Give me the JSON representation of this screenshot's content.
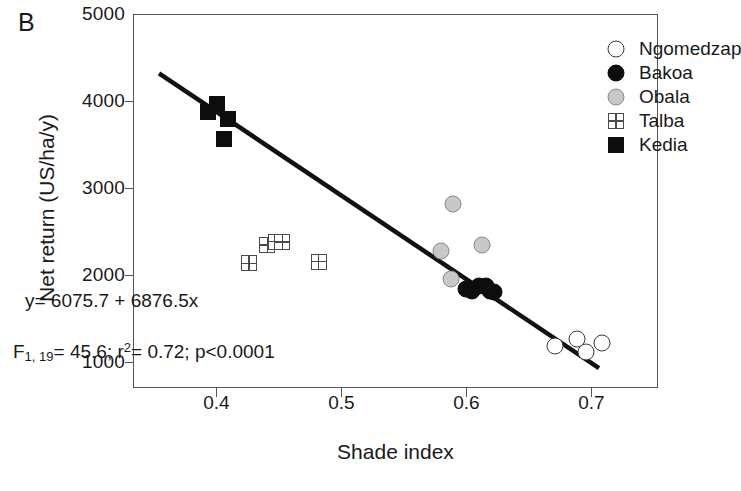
{
  "panel_label": "B",
  "chart_data": {
    "type": "scatter",
    "title": "",
    "xlabel": "Shade index",
    "ylabel": "Net return (US/ha/y)",
    "xlim": [
      0.3333,
      0.7533
    ],
    "ylim": [
      700,
      5000
    ],
    "xticks": [
      0.4,
      0.5,
      0.6,
      0.7
    ],
    "xtick_labels": [
      "0.4",
      "0.5",
      "0.6",
      "0.7"
    ],
    "yticks": [
      1000,
      2000,
      3000,
      4000,
      5000
    ],
    "ytick_labels": [
      "1000",
      "2000",
      "3000",
      "4000",
      "5000"
    ],
    "grid": false,
    "legend_position": "top-right",
    "annotations": {
      "equation": "y= 6075.7 + 6876.5x",
      "stat_f_symbol": "F",
      "stat_f_subscript": "1, 19",
      "stat_f_value": "= 45.6; ",
      "stat_r_symbol": "r",
      "stat_r_superscript": "2",
      "stat_r_value": "= 0.72; ",
      "stat_p_value": "p<0.0001"
    },
    "regression_line": {
      "x_start": 0.3533,
      "y_start": 4330,
      "x_end": 0.7053,
      "y_end": 940,
      "color": "#111111",
      "width": 4.5
    },
    "series": [
      {
        "name": "Ngomedzap",
        "marker": "circle-open",
        "color": "#ffffff",
        "edge_color": "#3a3a3a",
        "points": [
          {
            "x": 0.67,
            "y": 1195
          },
          {
            "x": 0.688,
            "y": 1270
          },
          {
            "x": 0.695,
            "y": 1130
          },
          {
            "x": 0.708,
            "y": 1230
          }
        ]
      },
      {
        "name": "Bakoa",
        "marker": "circle-filled",
        "color": "#0d0d0d",
        "edge_color": "#0d0d0d",
        "points": [
          {
            "x": 0.5985,
            "y": 1855
          },
          {
            "x": 0.604,
            "y": 1830
          },
          {
            "x": 0.609,
            "y": 1880
          },
          {
            "x": 0.615,
            "y": 1885
          },
          {
            "x": 0.618,
            "y": 1830
          },
          {
            "x": 0.6215,
            "y": 1815
          }
        ]
      },
      {
        "name": "Obala",
        "marker": "circle-grey",
        "color": "#c8c8c8",
        "edge_color": "#8a8a8a",
        "points": [
          {
            "x": 0.5885,
            "y": 2825
          },
          {
            "x": 0.579,
            "y": 2290
          },
          {
            "x": 0.6115,
            "y": 2360
          },
          {
            "x": 0.587,
            "y": 1965
          }
        ]
      },
      {
        "name": "Talba",
        "marker": "square-grid",
        "color": "#ffffff",
        "edge_color": "#4a4a4a",
        "points": [
          {
            "x": 0.4255,
            "y": 2145
          },
          {
            "x": 0.44,
            "y": 2355
          },
          {
            "x": 0.447,
            "y": 2395
          },
          {
            "x": 0.452,
            "y": 2390
          },
          {
            "x": 0.481,
            "y": 2165
          }
        ]
      },
      {
        "name": "Kedia",
        "marker": "square-filled",
        "color": "#0d0d0d",
        "edge_color": "#0d0d0d",
        "points": [
          {
            "x": 0.3925,
            "y": 3880
          },
          {
            "x": 0.3995,
            "y": 3975
          },
          {
            "x": 0.4085,
            "y": 3800
          },
          {
            "x": 0.4055,
            "y": 3575
          }
        ]
      }
    ]
  }
}
